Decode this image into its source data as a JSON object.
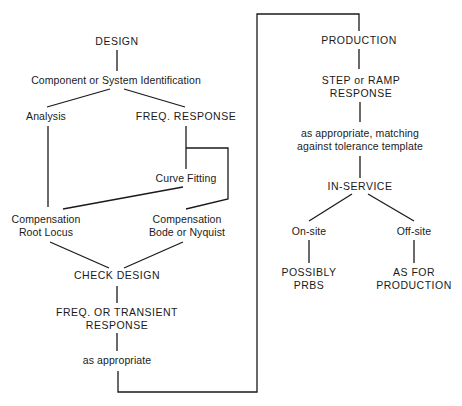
{
  "diagram": {
    "left_column": {
      "design": {
        "lines": [
          "DESIGN"
        ],
        "x": 117,
        "y": 35
      },
      "identification": {
        "lines": [
          "Component or System Identification"
        ],
        "x": 116,
        "y": 73
      },
      "analysis": {
        "lines": [
          "Analysis"
        ],
        "x": 46,
        "y": 110
      },
      "freq_response": {
        "lines": [
          "FREQ. RESPONSE"
        ],
        "x": 186,
        "y": 110
      },
      "curve_fitting": {
        "lines": [
          "Curve Fitting"
        ],
        "x": 186,
        "y": 172
      },
      "comp_root_locus": {
        "lines": [
          "Compensation",
          "Root Locus"
        ],
        "x": 46,
        "y": 214
      },
      "comp_bode": {
        "lines": [
          "Compensation",
          "Bode or Nyquist"
        ],
        "x": 187,
        "y": 214
      },
      "check_design": {
        "lines": [
          "CHECK DESIGN"
        ],
        "x": 117,
        "y": 269
      },
      "freq_transient": {
        "lines": [
          "FREQ. OR TRANSIENT",
          "RESPONSE"
        ],
        "x": 117,
        "y": 309
      },
      "as_appropriate": {
        "lines": [
          "as appropriate"
        ],
        "x": 117,
        "y": 354
      }
    },
    "right_column": {
      "production": {
        "lines": [
          "PRODUCTION"
        ],
        "x": 359,
        "y": 34
      },
      "step_ramp": {
        "lines": [
          "STEP or RAMP",
          "RESPONSE"
        ],
        "x": 360,
        "y": 73
      },
      "matching": {
        "lines": [
          "as appropriate, matching",
          "against tolerance template"
        ],
        "x": 360,
        "y": 125
      },
      "in_service": {
        "lines": [
          "IN-SERVICE"
        ],
        "x": 359,
        "y": 181
      },
      "on_site": {
        "lines": [
          "On-site"
        ],
        "x": 309,
        "y": 225
      },
      "off_site": {
        "lines": [
          "Off-site"
        ],
        "x": 413,
        "y": 225
      },
      "possibly_prbs": {
        "lines": [
          "POSSIBLY",
          "PRBS"
        ],
        "x": 309,
        "y": 266
      },
      "as_for_production": {
        "lines": [
          "AS FOR",
          "PRODUCTION"
        ],
        "x": 413,
        "y": 266
      }
    }
  }
}
